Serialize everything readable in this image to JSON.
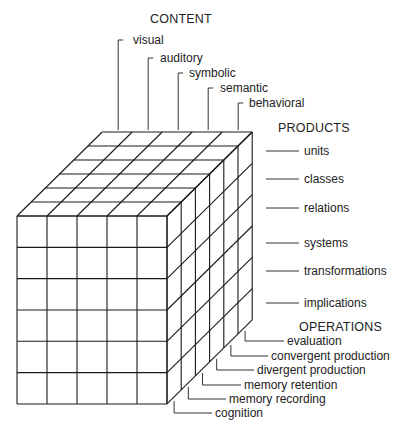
{
  "diagram": {
    "type": "structure-of-intellect-cube",
    "colors": {
      "line": "#1a1a1a",
      "background": "#ffffff",
      "text": "#222222"
    },
    "geometry": {
      "front_origin": [
        17,
        216
      ],
      "cell_width": 30,
      "cell_height": 31.33,
      "columns": 5,
      "rows": 6,
      "depth_layers": 6,
      "depth_step": [
        14.2,
        -14.0
      ]
    }
  },
  "content": {
    "header": "CONTENT",
    "items": [
      "visual",
      "auditory",
      "symbolic",
      "semantic",
      "behavioral"
    ]
  },
  "products": {
    "header": "PRODUCTS",
    "items": [
      "units",
      "classes",
      "relations",
      "systems",
      "transformations",
      "implications"
    ]
  },
  "operations": {
    "header": "OPERATIONS",
    "items": [
      "evaluation",
      "convergent production",
      "divergent production",
      "memory retention",
      "memory recording",
      "cognition"
    ]
  }
}
